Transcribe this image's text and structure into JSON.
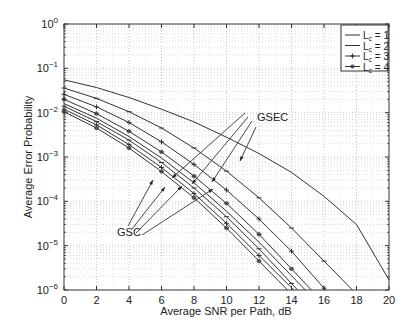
{
  "chart_data": {
    "type": "line",
    "title": "",
    "xlabel": "Average SNR per Path, dB",
    "ylabel": "Average Error Probability",
    "xlim": [
      0,
      20
    ],
    "ylim": [
      1e-06,
      1
    ],
    "yscale": "log",
    "grid": true,
    "legend_position": "upper right",
    "x_ticks": [
      0,
      2,
      4,
      6,
      8,
      10,
      12,
      14,
      16,
      18,
      20
    ],
    "y_ticks": [
      "10^0",
      "10^-1",
      "10^-2",
      "10^-3",
      "10^-4",
      "10^-5",
      "10^-6"
    ],
    "legend": [
      "L_c = 1",
      "L_c = 2",
      "L_c = 3",
      "L_c = 4"
    ],
    "annotations": [
      {
        "text": "GSEC",
        "x": 11.3,
        "y": 0.0065
      },
      {
        "text": "GSC",
        "x": 5.6,
        "y": 1.3e-05
      }
    ],
    "x": [
      0,
      2,
      4,
      6,
      8,
      10,
      12,
      14,
      16,
      18,
      20
    ],
    "series": [
      {
        "name": "GSEC L_c = 1",
        "marker": "none",
        "values": [
          0.055,
          0.037,
          0.022,
          0.012,
          0.0062,
          0.0028,
          0.0012,
          0.00045,
          0.00013,
          3e-05,
          1.7e-06
        ]
      },
      {
        "name": "GSEC L_c = 2",
        "marker": "tick",
        "values": [
          0.036,
          0.021,
          0.0105,
          0.0045,
          0.0016,
          0.00048,
          0.00012,
          2.5e-05,
          4.5e-06,
          null,
          null
        ]
      },
      {
        "name": "GSEC L_c = 3",
        "marker": "plus",
        "values": [
          0.026,
          0.0135,
          0.006,
          0.0022,
          0.00068,
          0.00018,
          4e-05,
          7.5e-06,
          1.1e-06,
          null,
          null
        ]
      },
      {
        "name": "GSEC L_c = 4",
        "marker": "star",
        "values": [
          0.02,
          0.0095,
          0.0038,
          0.0013,
          0.00037,
          9e-05,
          1.8e-05,
          3e-06,
          null,
          null,
          null
        ]
      },
      {
        "name": "GSC L_c = 1",
        "marker": "none",
        "values": [
          0.016,
          0.0075,
          0.0029,
          0.00095,
          0.00026,
          6e-05,
          1.2e-05,
          2.1e-06,
          null,
          null,
          null
        ]
      },
      {
        "name": "GSC L_c = 2",
        "marker": "tick",
        "values": [
          0.014,
          0.0063,
          0.0024,
          0.00075,
          0.0002,
          4.5e-05,
          8.5e-06,
          1.4e-06,
          null,
          null,
          null
        ]
      },
      {
        "name": "GSC L_c = 3",
        "marker": "plus",
        "values": [
          0.012,
          0.0053,
          0.0019,
          0.00058,
          0.00015,
          3.2e-05,
          6e-06,
          null,
          null,
          null,
          null
        ]
      },
      {
        "name": "GSC L_c = 4",
        "marker": "star",
        "values": [
          0.0105,
          0.0045,
          0.0016,
          0.00047,
          0.00012,
          2.5e-05,
          4.5e-06,
          null,
          null,
          null,
          null
        ]
      }
    ]
  },
  "labels": {
    "gsec": "GSEC",
    "gsc": "GSC",
    "xlabel": "Average SNR per Path, dB",
    "ylabel": "Average Error Probability",
    "legend": [
      "L",
      "L",
      "L",
      "L"
    ],
    "legend_sub": [
      "c",
      "c",
      "c",
      "c"
    ],
    "legend_val": [
      "= 1",
      "= 2",
      "= 3",
      "= 4"
    ]
  }
}
